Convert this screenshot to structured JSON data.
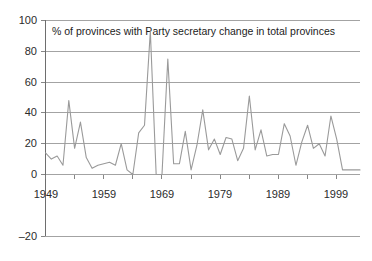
{
  "chart_data": {
    "type": "line",
    "title": "% of provinces with Party secretary change in total provinces",
    "xlabel": "",
    "ylabel": "",
    "ylim": [
      -20,
      100
    ],
    "xlim": [
      1949,
      2003
    ],
    "grid": true,
    "legend": "none",
    "line_color": "#9a9a9a",
    "yticks": [
      100,
      80,
      60,
      40,
      20,
      0,
      -20
    ],
    "ytick_labels": [
      "100",
      "80",
      "60",
      "40",
      "20",
      "0",
      "–20"
    ],
    "xticks": [
      1949,
      1959,
      1969,
      1979,
      1989,
      1999
    ],
    "xtick_labels": [
      "1949",
      "1959",
      "1969",
      "1979",
      "1989",
      "1999"
    ],
    "x_minor_tick_interval": 5,
    "x": [
      1949,
      1950,
      1951,
      1952,
      1953,
      1954,
      1955,
      1956,
      1957,
      1958,
      1959,
      1960,
      1961,
      1962,
      1963,
      1964,
      1965,
      1966,
      1967,
      1968,
      1969,
      1970,
      1971,
      1972,
      1973,
      1974,
      1975,
      1976,
      1977,
      1978,
      1979,
      1980,
      1981,
      1982,
      1983,
      1984,
      1985,
      1986,
      1987,
      1988,
      1989,
      1990,
      1991,
      1992,
      1993,
      1994,
      1995,
      1996,
      1997,
      1998,
      1999,
      2000,
      2001,
      2002,
      2003
    ],
    "values": [
      14,
      10,
      12,
      6,
      48,
      17,
      34,
      11,
      4,
      6,
      7,
      8,
      6,
      20,
      3,
      0,
      27,
      32,
      93,
      0,
      0,
      75,
      7,
      7,
      28,
      3,
      19,
      42,
      16,
      23,
      13,
      24,
      23,
      9,
      17,
      51,
      16,
      29,
      12,
      13,
      13,
      33,
      25,
      6,
      21,
      32,
      17,
      20,
      12,
      38,
      23,
      3,
      3,
      3,
      3
    ],
    "series_name": "% of provinces with Party secretary change"
  }
}
